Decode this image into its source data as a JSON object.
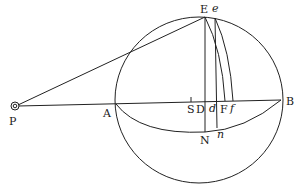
{
  "figure": {
    "type": "geometric-diagram",
    "points": {
      "P": {
        "label": "P",
        "x": 15,
        "y": 106
      },
      "A": {
        "label": "A",
        "x": 116,
        "y": 102
      },
      "B": {
        "label": "B",
        "x": 281,
        "y": 100
      },
      "E": {
        "label": "E",
        "x": 205,
        "y": 17
      },
      "e": {
        "label": "e",
        "x": 215,
        "y": 18
      },
      "S": {
        "label": "S",
        "x": 191,
        "y": 101
      },
      "D": {
        "label": "D",
        "x": 205,
        "y": 101
      },
      "d": {
        "label": "d",
        "x": 216,
        "y": 101
      },
      "F": {
        "label": "F",
        "x": 226,
        "y": 101
      },
      "f": {
        "label": "f",
        "x": 233,
        "y": 101
      },
      "N": {
        "label": "N",
        "x": 205,
        "y": 132
      },
      "n": {
        "label": "n",
        "x": 216,
        "y": 128
      }
    },
    "labels": {
      "P": "P",
      "A": "A",
      "B": "B",
      "E": "E",
      "e": "e",
      "S": "S",
      "D": "D",
      "d": "d",
      "F": "F",
      "f": "f",
      "N": "N",
      "n": "n"
    },
    "circle": {
      "cx": 198,
      "cy": 100,
      "r": 83
    }
  }
}
